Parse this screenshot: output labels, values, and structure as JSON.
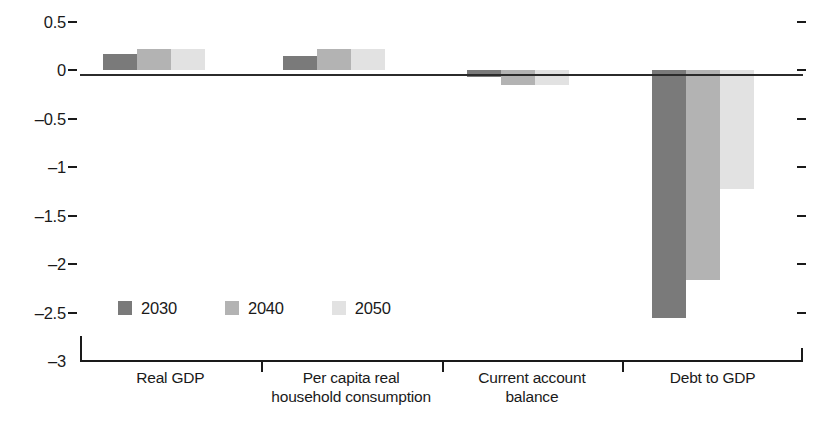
{
  "chart_data": {
    "type": "bar",
    "title": "",
    "subtitle": "",
    "xlabel": "",
    "ylabel": "",
    "grid": false,
    "legend_position": "inside-bottom-left",
    "ylim": [
      -3,
      0.5
    ],
    "y_ticks": [
      0.5,
      0,
      -0.5,
      -1,
      -1.5,
      -2,
      -2.5,
      -3
    ],
    "y_tick_labels": [
      "0.5",
      "0",
      "–0.5",
      "–1",
      "–1.5",
      "–2",
      "–2.5",
      "–3"
    ],
    "categories": [
      "Real GDP",
      "Per capita real household consumption",
      "Current account balance",
      "Debt to GDP"
    ],
    "category_lines": [
      [
        "Real GDP"
      ],
      [
        "Per capita real",
        "household consumption"
      ],
      [
        "Current account",
        "balance"
      ],
      [
        "Debt to GDP"
      ]
    ],
    "series": [
      {
        "name": "2030",
        "color": "#7a7a7a",
        "values": [
          0.17,
          0.15,
          -0.07,
          -2.56
        ]
      },
      {
        "name": "2040",
        "color": "#b3b3b3",
        "values": [
          0.22,
          0.22,
          -0.15,
          -2.16
        ]
      },
      {
        "name": "2050",
        "color": "#e2e2e2",
        "values": [
          0.22,
          0.22,
          -0.15,
          -1.22
        ]
      }
    ]
  },
  "legend": {
    "items": [
      {
        "label": "2030",
        "color": "#7a7a7a"
      },
      {
        "label": "2040",
        "color": "#b3b3b3"
      },
      {
        "label": "2050",
        "color": "#e2e2e2"
      }
    ]
  },
  "axis": {
    "zero_line_color": "#2b2b2b",
    "axis_color": "#1a1a1a"
  }
}
